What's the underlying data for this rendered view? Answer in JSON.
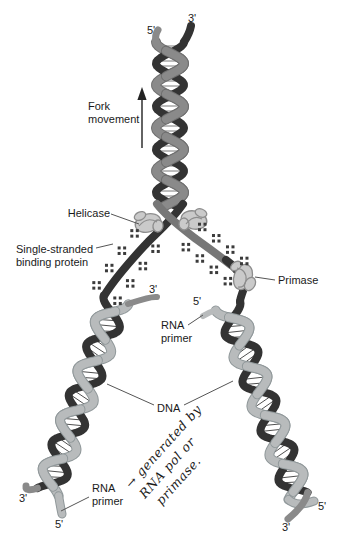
{
  "labels": {
    "fork_movement": {
      "line1": "Fork",
      "line2": "movement"
    },
    "helicase": "Helicase",
    "single_stranded_binding_protein": {
      "line1": "Single-stranded",
      "line2": "binding protein"
    },
    "primase": "Primase",
    "dna": "DNA",
    "rna_primer_upper": {
      "line1": "RNA",
      "line2": "primer"
    },
    "rna_primer_lower": {
      "line1": "RNA",
      "line2": "primer"
    }
  },
  "strand_end_labels": {
    "top_helix_left": "5'",
    "top_helix_right": "3'",
    "fork_left_new_strand": "3'",
    "fork_right_new_strand": "5'",
    "bottom_left_helix_outer": "3'",
    "bottom_left_helix_inner": "5'",
    "bottom_right_helix_outer": "5'",
    "bottom_right_helix_inner": "3'"
  },
  "handwritten_note": {
    "line1": "→ generated by",
    "line2": "RNA pol or",
    "line3": "primase."
  },
  "colors": {
    "background": "#ffffff",
    "strand_dark": "#333333",
    "strand_gray": "#8a8a8a",
    "strand_mid": "#777777",
    "strand_gray_edge": "#6f6f6f",
    "strand_light": "#b8bbbc",
    "strand_light_edge": "#90989a",
    "rung_top": "#7a7a7a",
    "rung_lower": "#505050",
    "protein_fill": "#cacaca",
    "protein_outline": "#8d8d8d",
    "ssb_dots": "#3b3b3b",
    "label_text": "#1a1a1a",
    "leader_line": "#555555",
    "handwriting": "#c7caca"
  }
}
